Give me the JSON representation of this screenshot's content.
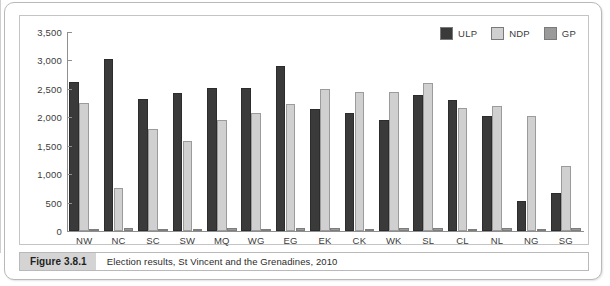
{
  "figure": {
    "caption_tag": "Figure 3.8.1",
    "caption_text": "Election results, St Vincent and the Grenadines, 2010"
  },
  "legend": {
    "position": "top-right",
    "items": [
      {
        "label": "ULP",
        "color": "#3a3a3a"
      },
      {
        "label": "NDP",
        "color": "#d0d0d0"
      },
      {
        "label": "GP",
        "color": "#9a9a9a"
      }
    ]
  },
  "chart_data": {
    "type": "bar",
    "title": "Election results, St Vincent and the Grenadines, 2010",
    "xlabel": "",
    "ylabel": "",
    "ylim": [
      0,
      3500
    ],
    "ytick_labels": [
      "3,500",
      "3,000",
      "2,500",
      "2,000",
      "1,500",
      "1,000",
      "500",
      "0"
    ],
    "ytick_values": [
      3500,
      3000,
      2500,
      2000,
      1500,
      1000,
      500,
      0
    ],
    "grid": false,
    "legend_position": "top-right",
    "categories": [
      "NW",
      "NC",
      "SC",
      "SW",
      "MQ",
      "WG",
      "EG",
      "EK",
      "CK",
      "WK",
      "SL",
      "CL",
      "NL",
      "NG",
      "SG"
    ],
    "series": [
      {
        "name": "ULP",
        "color": "#3a3a3a",
        "values": [
          2620,
          3020,
          2330,
          2430,
          2520,
          2510,
          2910,
          2140,
          2080,
          1960,
          2400,
          2300,
          2020,
          520,
          660
        ]
      },
      {
        "name": "NDP",
        "color": "#d0d0d0",
        "values": [
          2250,
          750,
          1790,
          1580,
          1960,
          2080,
          2240,
          2490,
          2450,
          2440,
          2600,
          2170,
          2200,
          2020,
          1150
        ]
      },
      {
        "name": "GP",
        "color": "#9a9a9a",
        "values": [
          40,
          50,
          35,
          40,
          45,
          40,
          50,
          45,
          40,
          45,
          50,
          40,
          45,
          40,
          45
        ]
      }
    ]
  }
}
